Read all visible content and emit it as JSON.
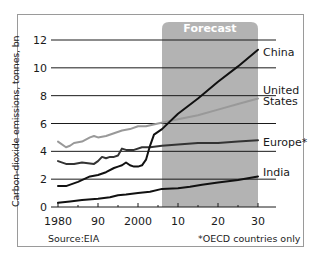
{
  "chart_data": {
    "type": "line",
    "title": "",
    "xlabel": "",
    "ylabel": "Carbon-dioxide emissions, tonnes, bn",
    "ylim": [
      0,
      12
    ],
    "xlim": [
      1980,
      2030
    ],
    "grid": true,
    "yticks": [
      0,
      2,
      4,
      6,
      8,
      10,
      12
    ],
    "xticks": [
      1980,
      1990,
      2000,
      2010,
      2020,
      2030
    ],
    "xtick_labels": [
      "1980",
      "90",
      "2000",
      "10",
      "20",
      "30"
    ],
    "forecast_band": {
      "label": "Forecast",
      "from": 2006,
      "to": 2030,
      "color": "#b3b3b3"
    },
    "series": [
      {
        "name": "China",
        "color": "#111111",
        "points": [
          [
            1980,
            1.5
          ],
          [
            1982,
            1.5
          ],
          [
            1985,
            1.8
          ],
          [
            1988,
            2.2
          ],
          [
            1990,
            2.3
          ],
          [
            1992,
            2.5
          ],
          [
            1994,
            2.8
          ],
          [
            1995,
            2.9
          ],
          [
            1996,
            3.0
          ],
          [
            1997,
            3.2
          ],
          [
            1998,
            3.0
          ],
          [
            1999,
            2.9
          ],
          [
            2000,
            2.9
          ],
          [
            2001,
            3.0
          ],
          [
            2002,
            3.4
          ],
          [
            2003,
            4.4
          ],
          [
            2004,
            5.2
          ],
          [
            2006,
            5.6
          ],
          [
            2010,
            6.7
          ],
          [
            2015,
            7.8
          ],
          [
            2020,
            9.0
          ],
          [
            2025,
            10.1
          ],
          [
            2030,
            11.3
          ]
        ]
      },
      {
        "name": "United States",
        "label_lines": [
          "United",
          "States"
        ],
        "color": "#999999",
        "points": [
          [
            1980,
            4.7
          ],
          [
            1982,
            4.3
          ],
          [
            1983,
            4.4
          ],
          [
            1984,
            4.6
          ],
          [
            1986,
            4.7
          ],
          [
            1988,
            5.0
          ],
          [
            1989,
            5.1
          ],
          [
            1990,
            5.0
          ],
          [
            1992,
            5.1
          ],
          [
            1994,
            5.3
          ],
          [
            1996,
            5.5
          ],
          [
            1998,
            5.6
          ],
          [
            2000,
            5.8
          ],
          [
            2002,
            5.8
          ],
          [
            2005,
            6.0
          ],
          [
            2010,
            6.3
          ],
          [
            2015,
            6.6
          ],
          [
            2020,
            7.0
          ],
          [
            2025,
            7.4
          ],
          [
            2030,
            7.8
          ]
        ]
      },
      {
        "name": "Europe*",
        "color": "#333333",
        "points": [
          [
            1980,
            3.3
          ],
          [
            1982,
            3.1
          ],
          [
            1984,
            3.1
          ],
          [
            1986,
            3.2
          ],
          [
            1989,
            3.1
          ],
          [
            1990,
            3.3
          ],
          [
            1991,
            3.6
          ],
          [
            1992,
            3.5
          ],
          [
            1993,
            3.6
          ],
          [
            1994,
            3.6
          ],
          [
            1995,
            3.7
          ],
          [
            1996,
            4.2
          ],
          [
            1997,
            4.1
          ],
          [
            1999,
            4.1
          ],
          [
            2001,
            4.3
          ],
          [
            2003,
            4.3
          ],
          [
            2006,
            4.4
          ],
          [
            2010,
            4.5
          ],
          [
            2015,
            4.6
          ],
          [
            2020,
            4.6
          ],
          [
            2025,
            4.7
          ],
          [
            2030,
            4.8
          ]
        ]
      },
      {
        "name": "India",
        "color": "#111111",
        "points": [
          [
            1980,
            0.3
          ],
          [
            1983,
            0.4
          ],
          [
            1986,
            0.5
          ],
          [
            1990,
            0.6
          ],
          [
            1993,
            0.7
          ],
          [
            1995,
            0.85
          ],
          [
            1997,
            0.9
          ],
          [
            2000,
            1.0
          ],
          [
            2003,
            1.1
          ],
          [
            2006,
            1.3
          ],
          [
            2010,
            1.35
          ],
          [
            2013,
            1.45
          ],
          [
            2016,
            1.6
          ],
          [
            2020,
            1.75
          ],
          [
            2025,
            1.95
          ],
          [
            2030,
            2.2
          ]
        ]
      }
    ],
    "legend": "inline labels at right end of lines",
    "source": "Source:EIA",
    "footnote": "*OECD countries only"
  },
  "labels": {
    "forecast": "Forecast",
    "ylabel": "Carbon-dioxide emissions, tonnes, bn",
    "source": "Source:EIA",
    "footnote": "*OECD countries only",
    "china": "China",
    "us_line1": "United",
    "us_line2": "States",
    "europe": "Europe*",
    "india": "India",
    "y_ticks": [
      "0",
      "2",
      "4",
      "6",
      "8",
      "10",
      "12"
    ],
    "x_ticks": [
      "1980",
      "90",
      "2000",
      "10",
      "20",
      "30"
    ]
  }
}
